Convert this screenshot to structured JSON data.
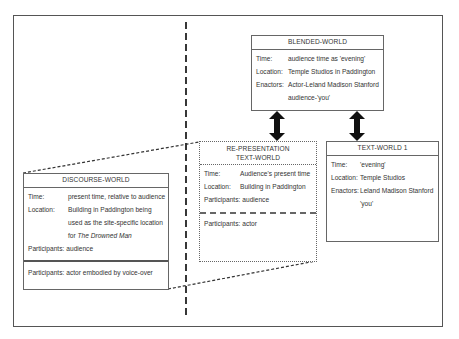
{
  "diagram": {
    "type": "text-world-diagram",
    "blended_world": {
      "title": "BLENDED-WORLD",
      "rows": [
        {
          "label": "Time:",
          "value": "audience time as 'evening'"
        },
        {
          "label": "Location:",
          "value": "Temple Studios in Paddington"
        },
        {
          "label": "Enactors:",
          "value": "Actor-Leland Madison Stanford"
        },
        {
          "label": "",
          "value": "audience-'you'"
        }
      ]
    },
    "representation_world": {
      "title_line1": "RE-PRESENTATION",
      "title_line2": "TEXT-WORLD",
      "rows": [
        {
          "label": "Time:",
          "value": "Audience's present time"
        },
        {
          "label": "Location:",
          "value": "Building in Paddington"
        },
        {
          "label": "Participants:",
          "value": "audience"
        }
      ],
      "lower_rows": [
        {
          "label": "Participants:",
          "value": "actor"
        }
      ]
    },
    "text_world_1": {
      "title": "TEXT-WORLD 1",
      "rows": [
        {
          "label": "Time:",
          "value": "'evening'"
        },
        {
          "label": "Location:",
          "value": "Temple Studios"
        },
        {
          "label": "Enactors:",
          "value": "Leland Madison Stanford"
        },
        {
          "label": "",
          "value": "'you'"
        }
      ]
    },
    "discourse_world": {
      "title": "DISCOURSE-WORLD",
      "rows": [
        {
          "label": "Time:",
          "value": "present time, relative to audience"
        },
        {
          "label": "Location:",
          "value": "Building in Paddington being"
        },
        {
          "label": "",
          "value": "used as the site-specific location"
        },
        {
          "label": "",
          "value_prefix": "for ",
          "value_italic": "The Drowned Man"
        },
        {
          "label": "Participants:",
          "value": "audience"
        }
      ],
      "lower_rows": [
        {
          "label": "Participants:",
          "value": "actor embodied by voice-over"
        }
      ]
    },
    "connectors": [
      {
        "from": "blended_world",
        "to": "representation_world",
        "type": "double-arrow"
      },
      {
        "from": "blended_world",
        "to": "text_world_1",
        "type": "double-arrow"
      },
      {
        "from": "discourse_world",
        "to": "representation_world",
        "type": "dashed-projection"
      }
    ],
    "colors": {
      "line": "#555555",
      "text": "#333333",
      "arrow": "#111111"
    }
  }
}
